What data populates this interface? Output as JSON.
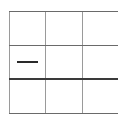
{
  "board": {
    "rows": 3,
    "cols": 3,
    "line_colors": {
      "vertical": "#9a9a9a",
      "horizontal": "#6a6a6a",
      "thick_horizontal": "#3a3a3a",
      "mark": "#2a2a2a"
    },
    "cells": [
      [
        "",
        "",
        ""
      ],
      [
        "dash",
        "",
        ""
      ],
      [
        "",
        "",
        ""
      ]
    ]
  }
}
